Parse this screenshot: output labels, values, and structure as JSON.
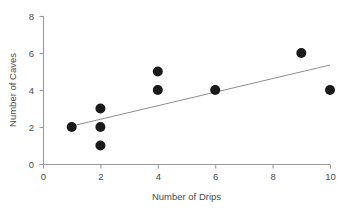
{
  "chart_data": {
    "type": "scatter",
    "title": "",
    "xlabel": "Number of Drips",
    "ylabel": "Number of Caves",
    "xlim": [
      0,
      10
    ],
    "ylim": [
      0,
      8
    ],
    "xticks": [
      0,
      2,
      4,
      6,
      8,
      10
    ],
    "yticks": [
      0,
      2,
      4,
      6,
      8
    ],
    "xtick_labels": [
      "0",
      "2",
      "4",
      "6",
      "8",
      "10"
    ],
    "ytick_labels": [
      "0",
      "2",
      "4",
      "6",
      "8"
    ],
    "grid": false,
    "legend": null,
    "marker": {
      "shape": "circle",
      "color": "#1a1a1a",
      "radius_px": 5
    },
    "points": [
      {
        "x": 1,
        "y": 2
      },
      {
        "x": 2,
        "y": 3
      },
      {
        "x": 2,
        "y": 2
      },
      {
        "x": 2,
        "y": 1
      },
      {
        "x": 4,
        "y": 5
      },
      {
        "x": 4,
        "y": 4
      },
      {
        "x": 6,
        "y": 4
      },
      {
        "x": 9,
        "y": 6
      },
      {
        "x": 10,
        "y": 4
      }
    ],
    "trendline": {
      "type": "linear",
      "color": "#8d8d8d",
      "x_start": 1,
      "y_start": 2.05,
      "x_end": 10,
      "y_end": 5.35
    },
    "axis_color": "#9a9a9a",
    "text_color": "#4a4a4a",
    "background": "#ffffff"
  },
  "layout": {
    "plot_left_px": 43,
    "plot_bottom_px": 164,
    "plot_right_px": 330,
    "plot_top_px": 16
  }
}
